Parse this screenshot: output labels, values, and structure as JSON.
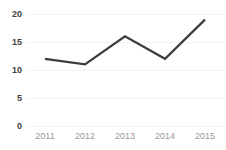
{
  "chart_data": {
    "type": "line",
    "title": "",
    "subtitle": "",
    "xlabel": "",
    "ylabel": "",
    "categories": [
      "2011",
      "2012",
      "2013",
      "2014",
      "2015"
    ],
    "values": [
      12,
      11,
      16,
      12,
      19
    ],
    "series": [
      {
        "name": "series-1",
        "values": [
          12,
          11,
          16,
          12,
          19
        ]
      }
    ],
    "ylim": [
      0,
      20
    ],
    "yticks": [
      0,
      5,
      10,
      15,
      20
    ],
    "ytick_labels": [
      "0",
      "5",
      "10",
      "15",
      "20"
    ],
    "xtick_labels": [
      "2011",
      "2012",
      "2013",
      "2014",
      "2015"
    ],
    "grid": true,
    "grid_axis": "y",
    "legend": false,
    "legend_position": "none",
    "markers": false,
    "colors": {
      "line": "#3c3c3c",
      "grid": "#f2f2f2",
      "ytick_text": "#3f3f3f",
      "xtick_text": "#9a9a9a",
      "background": "#ffffff"
    },
    "line_width": 2.2
  }
}
